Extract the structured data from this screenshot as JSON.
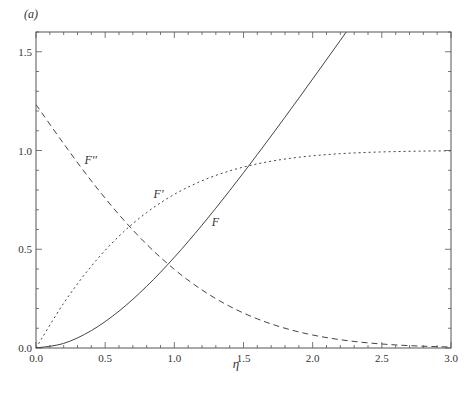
{
  "panel_label": "(a)",
  "chart_data": {
    "type": "line",
    "title": "",
    "xlabel": "η",
    "ylabel": "",
    "xlim": [
      0,
      3.0
    ],
    "ylim": [
      0,
      1.6
    ],
    "xticks": [
      "0.0",
      "0.5",
      "1.0",
      "1.5",
      "2.0",
      "2.5",
      "3.0"
    ],
    "yticks": [
      "0.0",
      "0.5",
      "1.0",
      "1.5"
    ],
    "x_minor_step": 0.1,
    "y_minor_step": 0.1,
    "grid": false,
    "legend": "inline labels",
    "x": [
      0,
      0.2,
      0.4,
      0.6,
      0.8,
      1.0,
      1.2,
      1.4,
      1.6,
      1.8,
      2.0,
      2.2,
      2.4,
      2.6,
      2.8,
      3.0
    ],
    "series": [
      {
        "name": "F",
        "style": "solid",
        "label_pos": [
          1.27,
          0.62
        ],
        "values": [
          0,
          0.0233,
          0.0881,
          0.1867,
          0.3124,
          0.4592,
          0.622,
          0.7967,
          0.9798,
          1.1689,
          1.362,
          1.5578,
          1.7553,
          1.9538,
          2.153,
          2.3526
        ]
      },
      {
        "name": "F'",
        "style": "dotted",
        "label_pos": [
          0.85,
          0.76
        ],
        "values": [
          0,
          0.2266,
          0.4145,
          0.5663,
          0.6859,
          0.7779,
          0.8467,
          0.8968,
          0.9323,
          0.9568,
          0.9732,
          0.9839,
          0.9905,
          0.9946,
          0.997,
          0.9984
        ]
      },
      {
        "name": "F''",
        "style": "dashed",
        "label_pos": [
          0.35,
          0.93
        ],
        "values": [
          1.2326,
          1.0345,
          0.8463,
          0.6752,
          0.5251,
          0.398,
          0.2938,
          0.211,
          0.1474,
          0.1,
          0.0658,
          0.042,
          0.026,
          0.0156,
          0.009,
          0.0051
        ]
      }
    ]
  }
}
